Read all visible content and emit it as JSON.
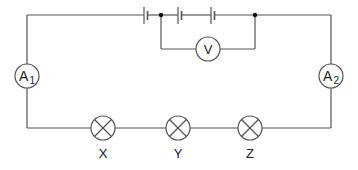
{
  "diagram": {
    "type": "circuit",
    "wire_color": "#555555",
    "components": {
      "battery": {
        "label": "",
        "cells": 3
      },
      "voltmeter": {
        "label": "V"
      },
      "ammeter_1": {
        "label": "A",
        "subscript": "1"
      },
      "ammeter_2": {
        "label": "A",
        "subscript": "2"
      },
      "lamps": [
        {
          "label": "X"
        },
        {
          "label": "Y"
        },
        {
          "label": "Z"
        }
      ]
    }
  }
}
